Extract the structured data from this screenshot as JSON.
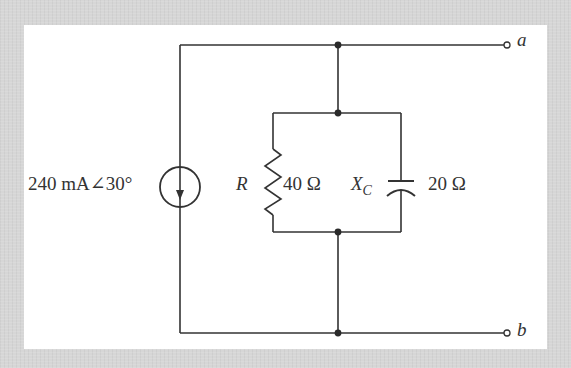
{
  "diagram": {
    "type": "circuit-schematic",
    "colors": {
      "background": "#d6d6d6",
      "panel": "#ffffff",
      "wire": "#333333"
    },
    "source": {
      "kind": "current-source",
      "label": "240 mA∠30°",
      "direction": "down"
    },
    "resistor": {
      "symbol": "R",
      "value": "40 Ω"
    },
    "capacitor": {
      "symbol": "X",
      "subscript": "C",
      "value": "20 Ω"
    },
    "terminals": {
      "top": "a",
      "bottom": "b"
    }
  }
}
